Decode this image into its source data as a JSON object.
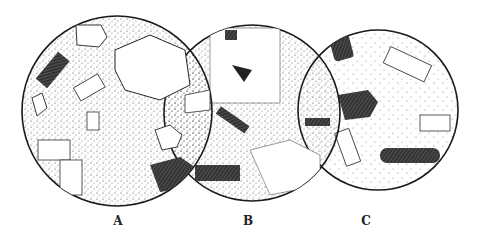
{
  "figure": {
    "panels": [
      {
        "label": "A",
        "cx": 117,
        "cy": 111,
        "r": 95
      },
      {
        "label": "B",
        "cx": 252,
        "cy": 113,
        "r": 88
      },
      {
        "label": "C",
        "cx": 378,
        "cy": 110,
        "r": 80
      }
    ],
    "colors": {
      "ink": "#1a1a1a",
      "paper": "#ffffff",
      "stipple": "#555555"
    }
  }
}
